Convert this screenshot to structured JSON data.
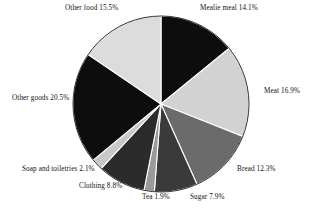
{
  "chart_data": {
    "type": "pie",
    "title": "",
    "subtitle": "",
    "xlabel": "",
    "ylabel": "",
    "legend_position": "none",
    "grid": false,
    "labels_show_percent": true,
    "start_angle_deg": 0,
    "direction": "clockwise",
    "categories": [
      "Mealie meal",
      "Meat",
      "Bread",
      "Sugar",
      "Tea",
      "Clothing",
      "Soap and toiletries",
      "Other goods",
      "Other food"
    ],
    "values": [
      14.1,
      16.9,
      12.3,
      7.9,
      1.9,
      8.8,
      2.1,
      20.5,
      15.5
    ],
    "slices": [
      {
        "name": "Mealie meal",
        "value": 14.1,
        "label": "Mealie meal 14.1%",
        "color": "#0d0d0d"
      },
      {
        "name": "Meat",
        "value": 16.9,
        "label": "Meat 16.9%",
        "color": "#d2d2d2"
      },
      {
        "name": "Bread",
        "value": 12.3,
        "label": "Bread 12.3%",
        "color": "#6b6b6b"
      },
      {
        "name": "Sugar",
        "value": 7.9,
        "label": "Sugar 7.9%",
        "color": "#3a3a3a"
      },
      {
        "name": "Tea",
        "value": 1.9,
        "label": "Tea 1.9%",
        "color": "#9a9a9a"
      },
      {
        "name": "Clothing",
        "value": 8.8,
        "label": "Clothing 8.8%",
        "color": "#2b2b2b"
      },
      {
        "name": "Soap and toiletries",
        "value": 2.1,
        "label": "Soap and toiletries 2.1%",
        "color": "#c8c8c8"
      },
      {
        "name": "Other goods",
        "value": 20.5,
        "label": "Other goods 20.5%",
        "color": "#0d0d0d"
      },
      {
        "name": "Other food",
        "value": 15.5,
        "label": "Other food 15.5%",
        "color": "#dcdcdc"
      }
    ],
    "total": 100.0,
    "units": "percent",
    "geometry": {
      "cx": 161,
      "cy": 104,
      "r": 88
    }
  }
}
